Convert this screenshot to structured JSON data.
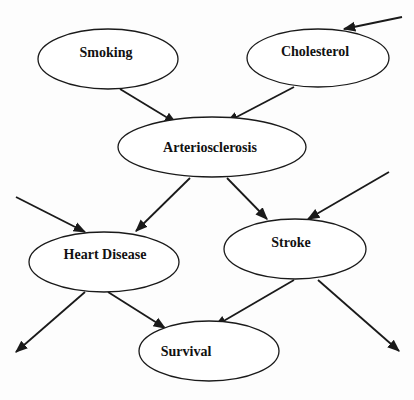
{
  "diagram": {
    "type": "bayesian-network",
    "top_cutoff_text": "",
    "nodes": [
      {
        "id": "smoking",
        "label": "Smoking",
        "cx": 108,
        "cy": 59,
        "rx": 70,
        "ry": 30
      },
      {
        "id": "cholesterol",
        "label": "Cholesterol",
        "cx": 318,
        "cy": 58,
        "rx": 71,
        "ry": 29
      },
      {
        "id": "arteriosclerosis",
        "label": "Arteriosclerosis",
        "cx": 212,
        "cy": 147,
        "rx": 94,
        "ry": 30
      },
      {
        "id": "heart_disease",
        "label": "Heart Disease",
        "cx": 104,
        "cy": 262,
        "rx": 75,
        "ry": 30
      },
      {
        "id": "stroke",
        "label": "Stroke",
        "cx": 295,
        "cy": 249,
        "rx": 71,
        "ry": 30
      },
      {
        "id": "survival",
        "label": "Survival",
        "cx": 209,
        "cy": 351,
        "rx": 70,
        "ry": 30
      }
    ],
    "edges": [
      {
        "from": "smoking",
        "to": "arteriosclerosis"
      },
      {
        "from": "cholesterol",
        "to": "arteriosclerosis"
      },
      {
        "from": "arteriosclerosis",
        "to": "heart_disease"
      },
      {
        "from": "arteriosclerosis",
        "to": "stroke"
      },
      {
        "from": "heart_disease",
        "to": "survival"
      },
      {
        "from": "stroke",
        "to": "survival"
      },
      {
        "from": "external",
        "to": "cholesterol"
      },
      {
        "from": "external",
        "to": "heart_disease"
      },
      {
        "from": "external",
        "to": "stroke"
      },
      {
        "from": "heart_disease",
        "to": "external"
      },
      {
        "from": "stroke",
        "to": "external"
      }
    ],
    "line_color": "#1a1a1a",
    "background": "#ffffff"
  }
}
